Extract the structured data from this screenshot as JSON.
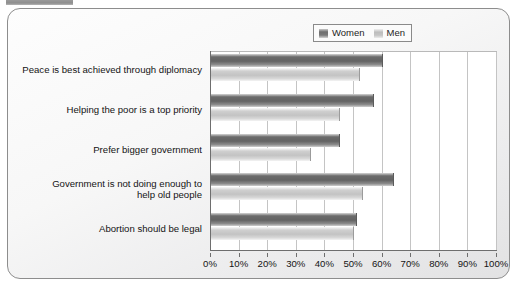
{
  "legend": {
    "entries": [
      {
        "label": "Women",
        "swatch": "women-swatch-icon",
        "color": "#6b6b6b"
      },
      {
        "label": "Men",
        "swatch": "men-swatch-icon",
        "color": "#c3c3c3"
      }
    ]
  },
  "chart_data": {
    "type": "bar",
    "orientation": "horizontal",
    "title": "",
    "subtitle": "",
    "xlabel": "",
    "ylabel": "",
    "xlim": [
      0,
      100
    ],
    "xtick_labels": [
      "0%",
      "10%",
      "20%",
      "30%",
      "40%",
      "50%",
      "60%",
      "70%",
      "80%",
      "90%",
      "100%"
    ],
    "xticks": [
      0,
      10,
      20,
      30,
      40,
      50,
      60,
      70,
      80,
      90,
      100
    ],
    "grid": "vertical",
    "legend_position": "top-right",
    "categories": [
      "Peace is best achieved through diplomacy",
      "Helping the poor is a top priority",
      "Prefer bigger government",
      "Government is not doing enough to help old people",
      "Abortion should be legal"
    ],
    "category_lines": [
      [
        "Peace is best achieved through diplomacy"
      ],
      [
        "Helping the poor is a top priority"
      ],
      [
        "Prefer bigger government"
      ],
      [
        "Government is not doing enough to",
        "help old people"
      ],
      [
        "Abortion should be legal"
      ]
    ],
    "series": [
      {
        "name": "Women",
        "color": "#6b6b6b",
        "values": [
          60,
          57,
          45,
          64,
          51
        ]
      },
      {
        "name": "Men",
        "color": "#c3c3c3",
        "values": [
          52,
          45,
          35,
          53,
          50
        ]
      }
    ]
  }
}
